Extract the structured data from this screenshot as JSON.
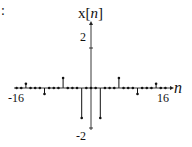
{
  "corner_text": ":",
  "chart_data": {
    "type": "stem",
    "title": "",
    "ylabel": "x[n]",
    "ylabel_parts": {
      "base": "x[",
      "var": "n",
      "close": "]"
    },
    "xlabel": "n",
    "xlim": [
      -16,
      16
    ],
    "ylim": [
      -2,
      2
    ],
    "x_tick_labels": [
      "-16",
      "16"
    ],
    "y_tick_labels": [
      "2",
      "-2"
    ],
    "grid": false,
    "legend": null,
    "x": [
      -16,
      -15,
      -14,
      -13,
      -12,
      -11,
      -10,
      -9,
      -8,
      -7,
      -6,
      -5,
      -4,
      -3,
      -2,
      -1,
      0,
      1,
      2,
      3,
      4,
      5,
      6,
      7,
      8,
      9,
      10,
      11,
      12,
      13,
      14,
      15,
      16
    ],
    "values": [
      0,
      0,
      0.21,
      0,
      0,
      0,
      -0.3,
      0,
      0,
      0,
      0.5,
      0,
      0,
      0,
      -1.5,
      0,
      0,
      0,
      -1.5,
      0,
      0,
      0,
      0.5,
      0,
      0,
      0,
      -0.3,
      0,
      0,
      0,
      0.21,
      0,
      0
    ]
  }
}
